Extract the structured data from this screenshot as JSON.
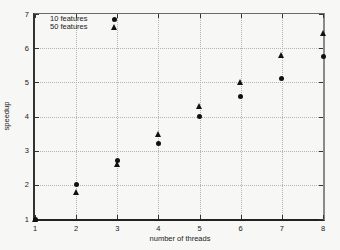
{
  "chart_data": {
    "type": "scatter",
    "x": [
      1,
      2,
      3,
      4,
      5,
      6,
      7,
      8
    ],
    "series": [
      {
        "name": "10 features",
        "marker": "circle",
        "values": [
          1.0,
          2.0,
          2.7,
          3.2,
          4.0,
          4.6,
          5.1,
          5.75
        ]
      },
      {
        "name": "50 features",
        "marker": "triangle",
        "values": [
          1.0,
          1.8,
          2.6,
          3.5,
          4.3,
          5.0,
          5.8,
          6.45
        ]
      }
    ],
    "title": "",
    "xlabel": "number of threads",
    "ylabel": "speedup",
    "xlim": [
      1,
      8
    ],
    "ylim": [
      1,
      7
    ],
    "xticks": [
      1,
      2,
      3,
      4,
      5,
      6,
      7,
      8
    ],
    "yticks": [
      1,
      2,
      3,
      4,
      5,
      6,
      7
    ],
    "grid": true,
    "grid_style": "dotted",
    "legend_position": "top-left",
    "marker_color": "#111111",
    "grid_color": "#b4b4b2",
    "background_color": "#f7f7f5"
  }
}
